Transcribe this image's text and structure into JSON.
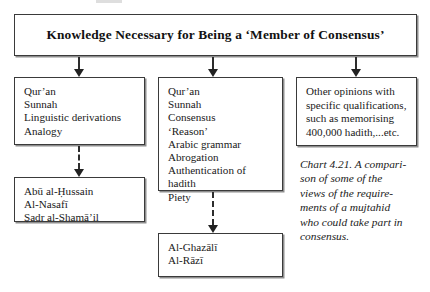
{
  "figure": {
    "header": {
      "title": "Knowledge Necessary for Being a ‘Member of Consensus’"
    },
    "columns": [
      {
        "name": "left",
        "top_box": {
          "lines": [
            "Qur’an",
            "Sunnah",
            "Linguistic derivations",
            "Analogy"
          ]
        },
        "bottom_box": {
          "lines": [
            "Abū al-Ḥussain",
            "Al-Nasafī",
            "Ṣadr al-Shamā’il"
          ]
        }
      },
      {
        "name": "middle",
        "top_box": {
          "lines": [
            "Qur’an",
            "Sunnah",
            "Consensus",
            "‘Reason’",
            "Arabic grammar",
            "Abrogation",
            "Authentication of",
            "hadith",
            "Piety"
          ]
        },
        "bottom_box": {
          "lines": [
            "Al-Ghazālī",
            "Al-Rāzī"
          ]
        }
      },
      {
        "name": "right",
        "top_box": {
          "lines": [
            "Other opinions with",
            "specific qualifications,",
            "such as memorising",
            "400,000 hadith,...etc."
          ]
        }
      }
    ],
    "caption": {
      "lines": [
        "Chart 4.21. A compari-",
        "son of some of the",
        "views of the require-",
        "ments of a mujtahid",
        "who could take part in",
        "consensus."
      ]
    },
    "arrows": [
      {
        "name": "header-to-left",
        "style": "dashed-down"
      },
      {
        "name": "header-to-mid",
        "style": "dashed-down"
      },
      {
        "name": "header-to-right",
        "style": "dashed-down"
      },
      {
        "name": "left-top-to-left-bottom",
        "style": "dashed-down"
      },
      {
        "name": "mid-top-to-mid-bottom",
        "style": "dashed-down"
      }
    ],
    "colors": {
      "border": "#3a3a3a",
      "shadow": "#8e8e8e",
      "text": "#1a1a1a",
      "background": "#ffffff"
    }
  }
}
